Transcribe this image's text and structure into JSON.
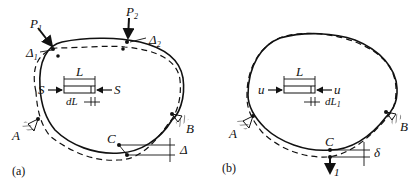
{
  "figure_a": {
    "caption": "(a)",
    "loads": [
      "P",
      "P"
    ],
    "load_subs": [
      "1",
      "2"
    ],
    "displacements": [
      "Δ",
      "Δ"
    ],
    "disp_subs": [
      "1",
      "2"
    ],
    "element_length": "L",
    "axial_force": "S",
    "elongation": "dL",
    "supports": [
      "A",
      "B"
    ],
    "point": "C",
    "point_displacement": "Δ"
  },
  "figure_b": {
    "caption": "(b)",
    "element_length": "L",
    "axial_force": "u",
    "elongation": "dL",
    "elongation_sub": "1",
    "supports": [
      "A",
      "B"
    ],
    "point": "C",
    "point_displacement": "δ",
    "unit_load": "1"
  }
}
